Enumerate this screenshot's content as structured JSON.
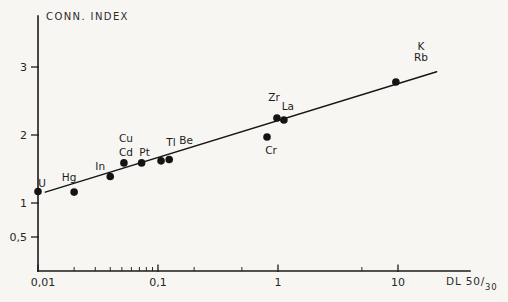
{
  "window": {
    "width": 508,
    "height": 302,
    "background": "#f7f6f2",
    "ink_color": "#1b1b1b",
    "text_color": "#262626"
  },
  "chart_data": {
    "type": "scatter",
    "title": "",
    "ylabel": "CONN. INDEX",
    "xlabel": "DL 50/30",
    "xlabel_main": "DL 50/",
    "xlabel_sub": "30",
    "x_scale": "log",
    "y_scale": "linear",
    "xlim": [
      0.01,
      40
    ],
    "ylim": [
      0,
      3.85
    ],
    "grid": false,
    "legend": false,
    "y_ticks": [
      {
        "value": 3,
        "label": "3"
      },
      {
        "value": 2,
        "label": "2"
      },
      {
        "value": 1,
        "label": "1"
      },
      {
        "value": 0.5,
        "label": "0,5"
      }
    ],
    "x_major_ticks": [
      {
        "value": 0.01,
        "label": "0,01",
        "label_dx": 5
      },
      {
        "value": 0.1,
        "label": "0,1",
        "label_dx": 0
      },
      {
        "value": 1,
        "label": "1",
        "label_dx": 0
      },
      {
        "value": 10,
        "label": "10",
        "label_dx": 0
      }
    ],
    "x_minor_ticks": [
      0.02,
      0.03,
      0.04,
      0.05,
      0.06,
      0.07,
      0.08,
      0.09,
      0.2,
      0.5,
      5
    ],
    "points": [
      {
        "labels": [
          "U"
        ],
        "x": 0.01,
        "y": 1.17,
        "dx": 4,
        "dy": -4,
        "gap": 13
      },
      {
        "labels": [
          "Hg"
        ],
        "x": 0.02,
        "y": 1.16,
        "dx": -5,
        "dy": -11,
        "gap": 13
      },
      {
        "labels": [
          "In"
        ],
        "x": 0.04,
        "y": 1.39,
        "dx": -10,
        "dy": -6,
        "gap": 13
      },
      {
        "labels": [
          "Cu",
          "Cd"
        ],
        "x": 0.052,
        "y": 1.59,
        "dx": 2,
        "dy": -21,
        "gap": 14
      },
      {
        "labels": [
          "Pt"
        ],
        "x": 0.073,
        "y": 1.59,
        "dx": 3,
        "dy": -7,
        "gap": 13
      },
      {
        "labels": [
          "Tl"
        ],
        "x": 0.106,
        "y": 1.62,
        "dx": 10,
        "dy": -15,
        "gap": 13
      },
      {
        "labels": [
          "Be"
        ],
        "x": 0.124,
        "y": 1.64,
        "dx": 17,
        "dy": -15,
        "gap": 13
      },
      {
        "labels": [
          "Cr"
        ],
        "x": 0.81,
        "y": 1.97,
        "dx": 4,
        "dy": 17,
        "gap": 13
      },
      {
        "labels": [
          "Zr"
        ],
        "x": 0.98,
        "y": 2.25,
        "dx": -3,
        "dy": -17,
        "gap": 13
      },
      {
        "labels": [
          "La"
        ],
        "x": 1.12,
        "y": 2.22,
        "dx": 4,
        "dy": -10,
        "gap": 13
      },
      {
        "labels": [
          "K",
          "Rb"
        ],
        "x": 9.6,
        "y": 2.78,
        "dx": 25,
        "dy": -32,
        "gap": 11
      }
    ],
    "trend_line": {
      "x1": 0.0115,
      "y1": 1.16,
      "x2": 21,
      "y2": 2.93
    }
  }
}
